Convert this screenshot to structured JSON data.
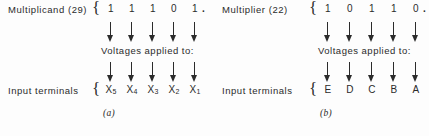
{
  "figure": {
    "background_color": "#fdfdfd",
    "ink_color": "#2b2b2b",
    "caption_text": "Voltages applied to:"
  },
  "panels": [
    {
      "id": "a",
      "label": "(a)",
      "operand_label": "Multiplicand (29)",
      "operand_value": 29,
      "brace_open": "{",
      "bits": [
        "1",
        "1",
        "1",
        "0",
        "1"
      ],
      "radix_point": ".",
      "caption": "Voltages applied to:",
      "terminals_label": "Input terminals",
      "terminals_brace": "{",
      "terminals": [
        {
          "name": "X",
          "subscript": "5"
        },
        {
          "name": "X",
          "subscript": "4"
        },
        {
          "name": "X",
          "subscript": "3"
        },
        {
          "name": "X",
          "subscript": "2"
        },
        {
          "name": "X",
          "subscript": "1"
        }
      ],
      "arrow_rows": 2,
      "arrows_per_row": 5
    },
    {
      "id": "b",
      "label": "(b)",
      "operand_label": "Multiplier (22)",
      "operand_value": 22,
      "brace_open": "{",
      "bits": [
        "1",
        "0",
        "1",
        "1",
        "0"
      ],
      "radix_point": ".",
      "caption": "Voltages applied to:",
      "terminals_label": "Input terminals",
      "terminals_brace": "{",
      "terminals": [
        {
          "name": "E",
          "subscript": ""
        },
        {
          "name": "D",
          "subscript": ""
        },
        {
          "name": "C",
          "subscript": ""
        },
        {
          "name": "B",
          "subscript": ""
        },
        {
          "name": "A",
          "subscript": ""
        }
      ],
      "arrow_rows": 2,
      "arrows_per_row": 5
    }
  ]
}
